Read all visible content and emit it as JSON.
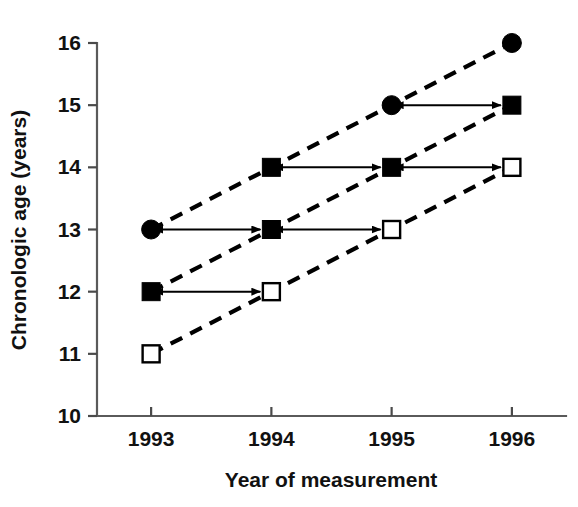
{
  "chart_data": {
    "type": "line",
    "title": "",
    "xlabel": "Year of measurement",
    "ylabel": "Chronologic age (years)",
    "x": [
      1993,
      1994,
      1995,
      1996
    ],
    "xticklabels": [
      "1993",
      "1994",
      "1995",
      "1996"
    ],
    "xlim": [
      1992.55,
      1996.45
    ],
    "yticks": [
      10,
      11,
      12,
      13,
      14,
      15,
      16
    ],
    "yticklabels": [
      "10",
      "11",
      "12",
      "13",
      "14",
      "15",
      "16"
    ],
    "ylim": [
      10,
      16
    ],
    "grid": false,
    "legend": "none",
    "series": [
      {
        "name": "Cohort A (oldest)",
        "x": [
          1993,
          1994,
          1995,
          1996
        ],
        "values": [
          13,
          14,
          15,
          16
        ],
        "markers": [
          "filled-circle",
          "filled-square",
          "filled-circle",
          "filled-circle"
        ],
        "linestyle": "dashed"
      },
      {
        "name": "Cohort B (middle)",
        "x": [
          1993,
          1994,
          1995,
          1996
        ],
        "values": [
          12,
          13,
          14,
          15
        ],
        "markers": [
          "filled-square",
          "filled-square",
          "filled-square",
          "filled-square"
        ],
        "linestyle": "dashed"
      },
      {
        "name": "Cohort C (youngest)",
        "x": [
          1993,
          1994,
          1995,
          1996
        ],
        "values": [
          11,
          12,
          13,
          14
        ],
        "markers": [
          "open-square",
          "open-square",
          "open-square",
          "open-square"
        ],
        "linestyle": "dashed"
      }
    ],
    "annotations": [
      {
        "type": "double-arrow",
        "y": 13,
        "x_from": 1993,
        "x_to": 1994,
        "label": ""
      },
      {
        "type": "double-arrow",
        "y": 12,
        "x_from": 1993,
        "x_to": 1994,
        "label": ""
      },
      {
        "type": "double-arrow",
        "y": 14,
        "x_from": 1994,
        "x_to": 1995,
        "label": ""
      },
      {
        "type": "double-arrow",
        "y": 13,
        "x_from": 1994,
        "x_to": 1995,
        "label": ""
      },
      {
        "type": "double-arrow",
        "y": 15,
        "x_from": 1995,
        "x_to": 1996,
        "label": ""
      },
      {
        "type": "double-arrow",
        "y": 14,
        "x_from": 1995,
        "x_to": 1996,
        "label": ""
      }
    ]
  }
}
